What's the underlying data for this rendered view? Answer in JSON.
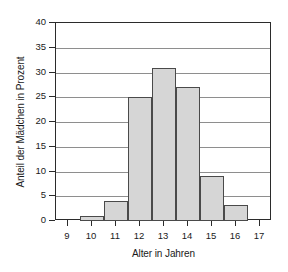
{
  "chart_data": {
    "type": "bar",
    "title": "",
    "xlabel": "Alter in Jahren",
    "ylabel": "Anteil der Mädchen in Prozent",
    "categories": [
      "9",
      "10",
      "11",
      "12",
      "13",
      "14",
      "15",
      "16",
      "17"
    ],
    "values": [
      0,
      1,
      4,
      25,
      31,
      27,
      9,
      3.3,
      0
    ],
    "xlim": [
      8.5,
      17.5
    ],
    "ylim": [
      0,
      40
    ],
    "yticks": [
      0,
      5,
      10,
      15,
      20,
      25,
      30,
      35,
      40
    ],
    "ytick_labels": [
      "0",
      "5",
      "10",
      "15",
      "20",
      "25",
      "30",
      "35",
      "40"
    ],
    "xticks": [
      9,
      10,
      11,
      12,
      13,
      14,
      15,
      16,
      17
    ],
    "xtick_labels": [
      "9",
      "10",
      "11",
      "12",
      "13",
      "14",
      "15",
      "16",
      "17"
    ],
    "grid": "horizontal",
    "legend": "none",
    "bar_fill_color": "#d6d6d6",
    "bar_edge_color": "#4a4a4a",
    "grid_color": "#8e8e8e",
    "axis_color": "#2b2b2b"
  }
}
